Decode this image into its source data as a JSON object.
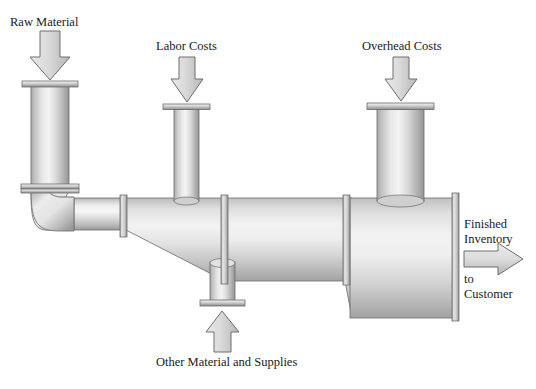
{
  "diagram": {
    "type": "process-flow-schematic",
    "background_color": "#ffffff",
    "pipe_colors": {
      "light": "#f2f2f2",
      "mid": "#c9c9c9",
      "dark": "#8f8f8f",
      "outline": "#5a5a5a",
      "flange_light": "#eaeaea",
      "flange_dark": "#9a9a9a",
      "arrow_fill_light": "#e0e0e0",
      "arrow_fill_dark": "#b4b4b4",
      "arrow_outline": "#6e6e6e",
      "text": "#1a1a1a"
    },
    "labels": {
      "raw_material": "Raw Material",
      "labor_costs": "Labor Costs",
      "overhead_costs": "Overhead Costs",
      "other_material": "Other Material and Supplies",
      "finished_line1": "Finished",
      "finished_line2": "Inventory",
      "to_customer_line1": "to",
      "to_customer_line2": "Customer"
    },
    "inputs": [
      {
        "name": "raw-material",
        "label": "Raw Material",
        "direction": "down",
        "pipe": "vertical-left"
      },
      {
        "name": "labor-costs",
        "label": "Labor Costs",
        "direction": "down",
        "pipe": "vertical-middle"
      },
      {
        "name": "overhead-costs",
        "label": "Overhead Costs",
        "direction": "down",
        "pipe": "vertical-right"
      },
      {
        "name": "other-material-and-supplies",
        "label": "Other Material and Supplies",
        "direction": "up",
        "pipe": "vertical-bottom-stub"
      }
    ],
    "output": {
      "name": "finished-inventory-to-customer",
      "label": "Finished Inventory to Customer",
      "direction": "right"
    }
  }
}
